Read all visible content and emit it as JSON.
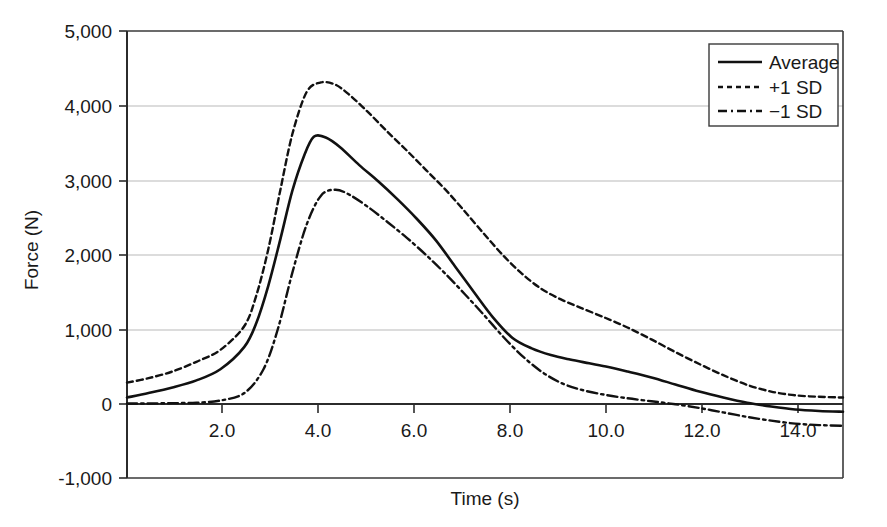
{
  "chart_data": {
    "type": "line",
    "title": "",
    "xlabel": "Time (s)",
    "ylabel": "Force (N)",
    "xlim": [
      0.55,
      15.5
    ],
    "ylim": [
      -1000,
      5000
    ],
    "grid": true,
    "grid_axis": "y",
    "legend_position": "top-right",
    "x_ticks": [
      2.0,
      4.0,
      6.0,
      8.0,
      10.0,
      12.0,
      14.0
    ],
    "x_tick_labels": [
      "2.0",
      "4.0",
      "6.0",
      "8.0",
      "10.0",
      "12.0",
      "14.0"
    ],
    "y_ticks": [
      -1000,
      0,
      1000,
      2000,
      3000,
      4000,
      5000
    ],
    "y_tick_labels": [
      "-1,000",
      "0",
      "1,000",
      "2,000",
      "3,000",
      "4,000",
      "5,000"
    ],
    "series": [
      {
        "name": "Average",
        "style": "solid",
        "color": "#111111",
        "width": 2.6,
        "x": [
          0.55,
          1.0,
          1.5,
          2.0,
          2.5,
          3.0,
          3.25,
          3.5,
          3.75,
          4.0,
          4.25,
          4.45,
          4.7,
          5.0,
          5.4,
          5.8,
          6.2,
          6.6,
          7.0,
          7.4,
          7.8,
          8.2,
          8.6,
          9.0,
          9.4,
          9.8,
          10.2,
          10.6,
          11.0,
          11.5,
          12.0,
          12.5,
          13.0,
          13.5,
          14.0,
          14.5,
          15.0,
          15.5
        ],
        "y": [
          80,
          140,
          215,
          310,
          460,
          760,
          1080,
          1580,
          2200,
          2850,
          3330,
          3580,
          3570,
          3440,
          3200,
          2980,
          2740,
          2480,
          2190,
          1840,
          1490,
          1150,
          880,
          740,
          650,
          590,
          540,
          490,
          430,
          350,
          255,
          160,
          80,
          10,
          -40,
          -80,
          -100,
          -110
        ]
      },
      {
        "name": "+1 SD",
        "style": "dashed",
        "color": "#111111",
        "width": 2.4,
        "x": [
          0.55,
          1.0,
          1.5,
          2.0,
          2.5,
          3.0,
          3.25,
          3.5,
          3.75,
          4.0,
          4.3,
          4.6,
          4.9,
          5.2,
          5.6,
          6.0,
          6.4,
          6.8,
          7.2,
          7.6,
          8.0,
          8.4,
          8.8,
          9.2,
          9.6,
          10.0,
          10.5,
          11.0,
          11.5,
          12.0,
          12.5,
          13.0,
          13.5,
          14.0,
          14.5,
          15.0,
          15.5
        ],
        "y": [
          280,
          340,
          430,
          560,
          720,
          1040,
          1450,
          2070,
          2860,
          3610,
          4180,
          4310,
          4280,
          4140,
          3900,
          3640,
          3390,
          3130,
          2870,
          2580,
          2280,
          1990,
          1740,
          1540,
          1400,
          1290,
          1160,
          1020,
          860,
          690,
          530,
          380,
          250,
          160,
          110,
          90,
          80
        ]
      },
      {
        "name": "-1 SD",
        "style": "dashdot",
        "color": "#111111",
        "width": 2.4,
        "x": [
          0.55,
          1.0,
          1.5,
          2.0,
          2.5,
          3.0,
          3.4,
          3.7,
          4.0,
          4.3,
          4.6,
          4.9,
          5.2,
          5.6,
          6.0,
          6.4,
          6.8,
          7.2,
          7.6,
          8.0,
          8.4,
          8.8,
          9.2,
          9.6,
          10.0,
          10.5,
          11.0,
          11.5,
          12.0,
          12.5,
          13.0,
          13.5,
          14.0,
          14.5,
          15.0,
          15.5
        ],
        "y": [
          0,
          0,
          5,
          10,
          40,
          140,
          460,
          1000,
          1750,
          2400,
          2790,
          2870,
          2800,
          2630,
          2430,
          2220,
          1990,
          1740,
          1470,
          1190,
          900,
          640,
          430,
          280,
          190,
          120,
          70,
          30,
          -10,
          -60,
          -120,
          -180,
          -230,
          -270,
          -290,
          -300
        ]
      }
    ]
  },
  "axis": {
    "y_label": "Force (N)",
    "x_label": "Time (s)"
  },
  "legend": {
    "entries": [
      {
        "label": "Average",
        "style": "solid"
      },
      {
        "label": "+1 SD",
        "style": "dashed"
      },
      {
        "label": "−1 SD",
        "style": "dashdot"
      }
    ]
  }
}
